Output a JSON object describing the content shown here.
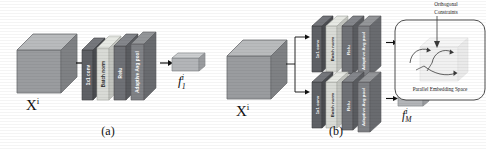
{
  "figure": {
    "panels": [
      {
        "id": "a",
        "caption": "(a)",
        "input_label": "X",
        "input_sup": "i",
        "branches": [
          {
            "layers": [
              {
                "name": "1x1 conv",
                "color": "#5f6166"
              },
              {
                "name": "Batch norm",
                "color": "#d9dbd6"
              },
              {
                "name": "Relu",
                "color": "#6f7176"
              },
              {
                "name": "Adaptive Avg pool",
                "color": "#808286"
              }
            ],
            "output": {
              "base": "f",
              "sub": "1",
              "sup": "i"
            }
          }
        ]
      },
      {
        "id": "b",
        "caption": "(b)",
        "input_label": "X",
        "input_sup": "i",
        "branch_dots": "• • •",
        "output_dots": "• • • •",
        "branches": [
          {
            "layers": [
              {
                "name": "1x1 conv",
                "color": "#5f6166"
              },
              {
                "name": "Batch norm",
                "color": "#d9dbd6"
              },
              {
                "name": "Relu",
                "color": "#6f7176"
              },
              {
                "name": "Adaptive Avg pool",
                "color": "#808286"
              }
            ],
            "output": {
              "base": "f",
              "sub": "1",
              "sup": "i"
            }
          },
          {
            "layers": [
              {
                "name": "1x1 conv",
                "color": "#5f6166"
              },
              {
                "name": "Batch norm",
                "color": "#d9dbd6"
              },
              {
                "name": "Relu",
                "color": "#6f7176"
              },
              {
                "name": "Adaptive Avg pool",
                "color": "#808286"
              }
            ],
            "output": {
              "base": "f",
              "sub": "M",
              "sup": "i"
            }
          }
        ],
        "loss": {
          "symbol": "ℒ",
          "subscript": "ort"
        },
        "embedding": {
          "title": "Orthogonal\nConstraints",
          "title_line1": "Orthogonal",
          "title_line2": "Constraints",
          "footer": "Parallel Embedding Space"
        }
      }
    ]
  },
  "colors": {
    "cube_front": "#9a9c9f",
    "cube_top": "#b9bbbd",
    "cube_side": "#7b7d80",
    "feature_front": "#b3b5b8",
    "feature_top": "#cdcfd1",
    "feature_side": "#8e9093",
    "arrow": "#111111",
    "text": "#111111",
    "panel_bg": "#ffffff"
  }
}
